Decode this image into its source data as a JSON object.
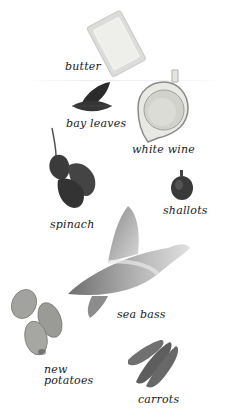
{
  "ingredients": [
    {
      "id": "butter",
      "label": "butter"
    },
    {
      "id": "bay_leaves",
      "label": "bay leaves"
    },
    {
      "id": "white_wine",
      "label": "white wine"
    },
    {
      "id": "spinach",
      "label": "spinach"
    },
    {
      "id": "shallots",
      "label": "shallots"
    },
    {
      "id": "sea_bass",
      "label": "sea bass"
    },
    {
      "id": "new_potatoes",
      "label_line1": "new",
      "label_line2": "potatoes"
    },
    {
      "id": "carrots",
      "label": "carrots"
    }
  ],
  "colors": {
    "background": "#ffffff",
    "text": "#1a1a1a",
    "butter": "#e9e9e6",
    "leaf_dark": "#2e2e2e",
    "wine": "#d6d6d0",
    "shallot": "#3a3a3a",
    "fish": "#a8a8a8",
    "potato": "#9c9c98",
    "carrot": "#6a6a6a"
  }
}
